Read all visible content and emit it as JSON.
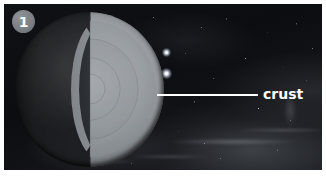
{
  "figure": {
    "kind": "earth-interior-cutaway-diagram",
    "step_number": "1",
    "background_scene": "deep space starfield with nebula"
  },
  "badge": {
    "number": "1",
    "shape": "circle",
    "fill_color": "#7b8085",
    "text_color": "#ffffff"
  },
  "callouts": [
    {
      "id": "crust",
      "label": "crust",
      "leader_line_color": "#ffffff",
      "text_color": "#ffffff",
      "points_to": "outer shell of the Earth cutaway"
    }
  ],
  "globe": {
    "name": "earth-cutaway",
    "left_hemisphere": "photographic Earth surface with continents and clouds",
    "right_hemisphere": "cut-away interior cross section",
    "layers": [
      {
        "name": "crust",
        "tone": "#262a2e"
      },
      {
        "name": "mantle",
        "tone": "#959a9e"
      },
      {
        "name": "outer-core",
        "tone": "#8c9195"
      },
      {
        "name": "inner-core",
        "tone": "#9aa0a4"
      }
    ]
  },
  "stars": [
    {
      "id": "bright-star-upper"
    },
    {
      "id": "bright-star-lower"
    }
  ],
  "frame": {
    "border_color": "#ffffff",
    "photo_background": "#0c0d10"
  }
}
